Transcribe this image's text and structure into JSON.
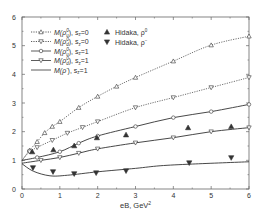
{
  "chart_data": {
    "type": "line",
    "title": "",
    "xlabel": "eB, GeV²",
    "ylabel": "",
    "xlim": [
      0,
      6
    ],
    "ylim": [
      0,
      6
    ],
    "xticks": [
      "0",
      "1",
      "2",
      "3",
      "4",
      "5",
      "6"
    ],
    "yticks": [
      "0",
      "1",
      "2",
      "3",
      "4",
      "5",
      "6"
    ],
    "grid": false,
    "legend_position": "upper left (two columns)",
    "series": [
      {
        "name": "M(ρ⁰_u), s_z=0",
        "style": "dotted",
        "marker": "open-triangle-up",
        "x": [
          0,
          0.2,
          0.4,
          0.6,
          0.8,
          1.0,
          1.5,
          2.0,
          2.5,
          3.0,
          4.0,
          5.0,
          6.0
        ],
        "y": [
          1.0,
          1.35,
          1.65,
          1.96,
          2.18,
          2.35,
          2.84,
          3.23,
          3.58,
          3.89,
          4.46,
          5.02,
          5.33
        ]
      },
      {
        "name": "M(ρ⁰_d), s_z=0",
        "style": "dotted",
        "marker": "open-triangle-down",
        "x": [
          0,
          0.2,
          0.4,
          0.8,
          1.2,
          1.6,
          2.0,
          3.0,
          4.0,
          5.0,
          6.0
        ],
        "y": [
          1.0,
          1.3,
          1.45,
          1.7,
          1.95,
          2.15,
          2.35,
          2.84,
          3.19,
          3.54,
          3.89
        ]
      },
      {
        "name": "M(ρ⁰_u), s_z=1",
        "style": "solid",
        "marker": "open-circle",
        "x": [
          0,
          0.4,
          1.0,
          1.5,
          2.0,
          3.0,
          4.0,
          5.0,
          6.0
        ],
        "y": [
          1.0,
          1.1,
          1.3,
          1.6,
          1.85,
          2.18,
          2.49,
          2.7,
          2.95
        ]
      },
      {
        "name": "M(ρ⁰_d), s_z=1",
        "style": "solid",
        "marker": "open-triangle-down",
        "x": [
          0,
          0.5,
          1.0,
          1.5,
          2.0,
          3.0,
          4.0,
          5.0,
          6.0
        ],
        "y": [
          0.9,
          1.0,
          1.1,
          1.25,
          1.4,
          1.61,
          1.79,
          2.0,
          2.14
        ]
      },
      {
        "name": "M(ρ⁻), s_z=1",
        "style": "solid",
        "marker": "none",
        "x": [
          0,
          0.3,
          0.74,
          1.2,
          2.0,
          3.0,
          3.65,
          4.5,
          6.0
        ],
        "y": [
          0.88,
          0.62,
          0.46,
          0.48,
          0.6,
          0.72,
          0.81,
          0.87,
          0.95
        ]
      },
      {
        "name": "Hidaka, ρ⁰",
        "style": "markers",
        "marker": "filled-triangle-up",
        "x": [
          0.27,
          0.83,
          1.38,
          1.98,
          2.75,
          4.39,
          5.53
        ],
        "y": [
          1.3,
          1.37,
          1.51,
          1.79,
          1.89,
          2.14,
          2.18
        ]
      },
      {
        "name": "Hidaka, ρ⁻",
        "style": "markers",
        "marker": "filled-triangle-down",
        "x": [
          0.29,
          0.82,
          1.38,
          1.96,
          2.75,
          4.42,
          5.53
        ],
        "y": [
          0.74,
          0.6,
          0.53,
          0.56,
          0.63,
          0.91,
          1.09
        ]
      }
    ]
  },
  "legend": {
    "left": [
      {
        "label_main": "M(ρ",
        "sup": "0",
        "sub": "u",
        "suffix": "), s",
        "sz_sub": "z",
        "sz_val": "=0"
      },
      {
        "label_main": "M(ρ",
        "sup": "0",
        "sub": "d",
        "suffix": "), s",
        "sz_sub": "z",
        "sz_val": "=0"
      },
      {
        "label_main": "M(ρ",
        "sup": "0",
        "sub": "u",
        "suffix": "), s",
        "sz_sub": "z",
        "sz_val": "=1"
      },
      {
        "label_main": "M(ρ",
        "sup": "0",
        "sub": "d",
        "suffix": "), s",
        "sz_sub": "z",
        "sz_val": "=1"
      },
      {
        "label_main": "M(ρ",
        "sup": "−",
        "sub": "",
        "suffix": "), s",
        "sz_sub": "z",
        "sz_val": "=1"
      }
    ],
    "right": [
      {
        "label_main": "Hidaka, ρ",
        "sup": "0"
      },
      {
        "label_main": "Hidaka, ρ",
        "sup": "−"
      }
    ]
  },
  "axes": {
    "x_label": "eB, GeV",
    "x_label_sup": "2",
    "x_ticks": [
      "0",
      "1",
      "2",
      "3",
      "4",
      "5",
      "6"
    ],
    "y_ticks": [
      "0",
      "1",
      "2",
      "3",
      "4",
      "5",
      "6"
    ]
  },
  "colors": {
    "line": "#333333",
    "marker": "#333333",
    "axis": "#555555"
  }
}
